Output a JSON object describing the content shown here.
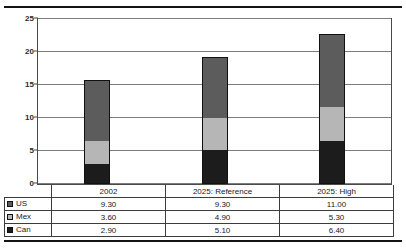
{
  "chart_data": {
    "type": "bar",
    "subtype": "stacked-column",
    "title": "",
    "xlabel": "",
    "ylabel": "",
    "ylim": [
      0,
      25
    ],
    "yticks": [
      0,
      5,
      10,
      15,
      20,
      25
    ],
    "ytick_labels": [
      "0",
      "5",
      "10",
      "15",
      "20",
      "25"
    ],
    "grid": true,
    "legend_position": "table-left",
    "categories": [
      "2002",
      "2025: Reference",
      "2025: High"
    ],
    "stack_order_bottom_to_top": [
      "Can",
      "Mex",
      "US"
    ],
    "series": [
      {
        "name": "US",
        "values": [
          9.3,
          9.3,
          11.0
        ],
        "labels": [
          "9.30",
          "9.30",
          "11.00"
        ],
        "color": "#5c5c5c",
        "swatch": "us-swatch-icon"
      },
      {
        "name": "Mex",
        "values": [
          3.6,
          4.9,
          5.3
        ],
        "labels": [
          "3.60",
          "4.90",
          "5.30"
        ],
        "color": "#b6b6b6",
        "swatch": "mex-swatch-icon"
      },
      {
        "name": "Can",
        "values": [
          2.9,
          5.1,
          6.4
        ],
        "labels": [
          "2.90",
          "5.10",
          "6.40"
        ],
        "color": "#1c1c1c",
        "swatch": "can-swatch-icon"
      }
    ],
    "totals": [
      15.8,
      19.3,
      22.7
    ]
  },
  "table": {
    "corner_label": "",
    "category_header": [
      "2002",
      "2025: Reference",
      "2025: High"
    ],
    "rows": [
      {
        "label": "US",
        "cells": [
          "9.30",
          "3.60",
          "2.90"
        ]
      },
      {
        "label": "Mex",
        "cells": [
          "9.30",
          "4.90",
          "5.10"
        ]
      },
      {
        "label": "Can",
        "cells": [
          "11.00",
          "5.30",
          "6.40"
        ]
      }
    ]
  },
  "colors": {
    "us": "#5c5c5c",
    "mex": "#b6b6b6",
    "can": "#1c1c1c",
    "gridline": "#7d7d7d",
    "border": "#3c3c3c",
    "rule": "#141414"
  }
}
